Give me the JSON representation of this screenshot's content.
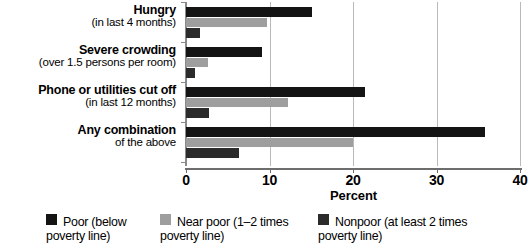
{
  "chart_data": {
    "type": "bar",
    "orientation": "horizontal",
    "title": "",
    "xlabel": "Percent",
    "ylabel": "",
    "xlim": [
      0,
      40
    ],
    "xticks": [
      0,
      10,
      20,
      30,
      40
    ],
    "xtick_labels": [
      "0",
      "10",
      "20",
      "30",
      "40"
    ],
    "grid": true,
    "grid_axis": "x",
    "legend_position": "bottom",
    "categories": [
      "Hungry (in last 4 months)",
      "Severe crowding (over 1.5 persons per room)",
      "Phone or utilities cut off (in last 12 months)",
      "Any combination of the above"
    ],
    "series": [
      {
        "name": "Poor (below poverty line)",
        "color": "#141414",
        "values": [
          15.1,
          9.1,
          21.4,
          35.8
        ]
      },
      {
        "name": "Near poor (1–2 times poverty line)",
        "color": "#9e9e9e",
        "values": [
          9.7,
          2.6,
          12.2,
          20.0
        ]
      },
      {
        "name": "Nonpoor (at least 2 times poverty line)",
        "color": "#2b2b2b",
        "values": [
          1.7,
          1.1,
          2.8,
          6.3
        ]
      }
    ]
  },
  "categories": [
    {
      "main": "Hungry",
      "sub": "(in last 4 months)"
    },
    {
      "main": "Severe crowding",
      "sub": "(over 1.5 persons per room)"
    },
    {
      "main": "Phone or utilities cut off",
      "sub": "(in last 12 months)"
    },
    {
      "main": "Any combination",
      "sub": "of the above"
    }
  ],
  "axis": {
    "title": "Percent",
    "ticks": [
      "0",
      "10",
      "20",
      "30",
      "40"
    ]
  },
  "legend": [
    {
      "line1": "Poor (below",
      "line2": "poverty line)",
      "color": "#141414"
    },
    {
      "line1": "Near poor (1–2 times",
      "line2": "poverty line)",
      "color": "#9e9e9e"
    },
    {
      "line1": "Nonpoor (at least 2 times",
      "line2": "poverty line)",
      "color": "#2b2b2b"
    }
  ]
}
